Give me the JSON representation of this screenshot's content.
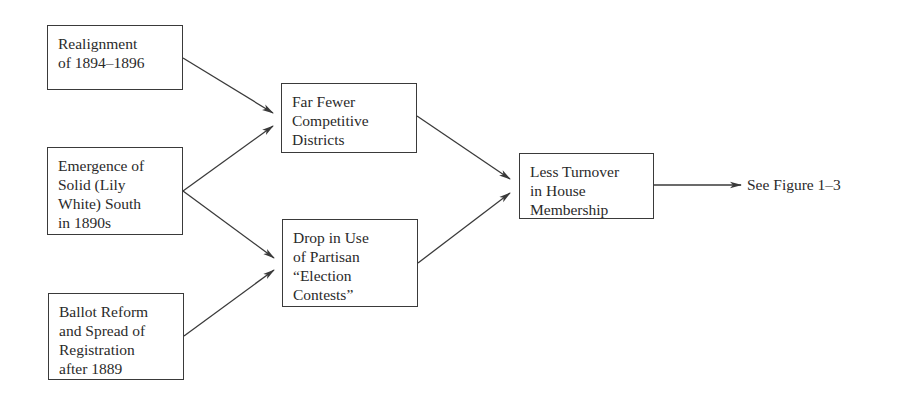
{
  "diagram": {
    "type": "causal-flow",
    "nodes": [
      {
        "id": "realignment",
        "lines": [
          "Realignment",
          "of 1894–1896"
        ],
        "box": {
          "x": 47,
          "y": 25,
          "w": 136,
          "h": 65
        }
      },
      {
        "id": "solid-south",
        "lines": [
          "Emergence of",
          "Solid (Lily",
          "White) South",
          "in 1890s"
        ],
        "box": {
          "x": 47,
          "y": 147,
          "w": 136,
          "h": 88
        }
      },
      {
        "id": "ballot-reform",
        "lines": [
          "Ballot Reform",
          "and Spread of",
          "Registration",
          "after 1889"
        ],
        "box": {
          "x": 48,
          "y": 293,
          "w": 136,
          "h": 87
        }
      },
      {
        "id": "fewer-competitive",
        "lines": [
          "Far Fewer",
          "Competitive",
          "Districts"
        ],
        "box": {
          "x": 281,
          "y": 83,
          "w": 136,
          "h": 70
        }
      },
      {
        "id": "drop-election-contests",
        "lines": [
          "Drop in Use",
          "of Partisan",
          "“Election",
          "Contests”"
        ],
        "box": {
          "x": 282,
          "y": 219,
          "w": 136,
          "h": 88
        }
      },
      {
        "id": "less-turnover",
        "lines": [
          "Less Turnover",
          "in House",
          "Membership"
        ],
        "box": {
          "x": 519,
          "y": 153,
          "w": 135,
          "h": 66
        }
      }
    ],
    "edges": [
      {
        "from": "realignment",
        "to": "fewer-competitive",
        "x1": 183,
        "y1": 58,
        "x2": 273,
        "y2": 113
      },
      {
        "from": "solid-south",
        "to": "fewer-competitive",
        "x1": 183,
        "y1": 191,
        "x2": 273,
        "y2": 126
      },
      {
        "from": "solid-south",
        "to": "drop-election-contests",
        "x1": 183,
        "y1": 191,
        "x2": 274,
        "y2": 258
      },
      {
        "from": "ballot-reform",
        "to": "drop-election-contests",
        "x1": 184,
        "y1": 336,
        "x2": 274,
        "y2": 270
      },
      {
        "from": "fewer-competitive",
        "to": "less-turnover",
        "x1": 417,
        "y1": 116,
        "x2": 510,
        "y2": 179
      },
      {
        "from": "drop-election-contests",
        "to": "less-turnover",
        "x1": 418,
        "y1": 263,
        "x2": 510,
        "y2": 193
      },
      {
        "from": "less-turnover",
        "to": "see-figure",
        "x1": 654,
        "y1": 185,
        "x2": 741,
        "y2": 185
      }
    ],
    "output_label": "See Figure 1–3",
    "colors": {
      "stroke": "#3a3a3a",
      "text": "#2a2a2a",
      "background": "#ffffff"
    }
  }
}
